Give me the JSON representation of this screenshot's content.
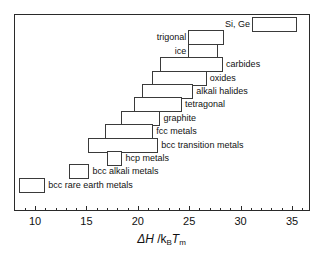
{
  "chart_data": {
    "type": "bar",
    "orientation": "horizontal-range",
    "title": "",
    "xlabel": "ΔH /k_B T_m",
    "ylabel": "",
    "xlim": [
      7.5,
      36.8
    ],
    "xticks": [
      10,
      15,
      20,
      25,
      30,
      35
    ],
    "xtick_labels": [
      "10",
      "15",
      "20",
      "25",
      "30",
      "35"
    ],
    "minor_tick_step": 1,
    "grid": false,
    "legend": "none",
    "categories": [
      "Si, Ge",
      "trigonal",
      "ice",
      "carbides",
      "oxides",
      "alkali halides",
      "tetragonal",
      "graphite",
      "fcc  metals",
      "bcc transition metals",
      "hcp metals",
      "bcc alkali metals",
      "bcc rare earth metals"
    ],
    "ranges": [
      {
        "label": "Si, Ge",
        "start": 31.1,
        "end": 35.5,
        "label_side": "left"
      },
      {
        "label": "trigonal",
        "start": 24.9,
        "end": 28.4,
        "label_side": "left"
      },
      {
        "label": "ice",
        "start": 24.9,
        "end": 27.8,
        "label_side": "left"
      },
      {
        "label": "carbides",
        "start": 22.2,
        "end": 28.3,
        "label_side": "right"
      },
      {
        "label": "oxides",
        "start": 21.4,
        "end": 26.7,
        "label_side": "right"
      },
      {
        "label": "alkali halides",
        "start": 20.4,
        "end": 25.4,
        "label_side": "right"
      },
      {
        "label": "tetragonal",
        "start": 19.6,
        "end": 24.3,
        "label_side": "right"
      },
      {
        "label": "graphite",
        "start": 18.4,
        "end": 22.2,
        "label_side": "right"
      },
      {
        "label": "fcc  metals",
        "start": 16.8,
        "end": 21.5,
        "label_side": "right"
      },
      {
        "label": "bcc transition metals",
        "start": 15.2,
        "end": 22.0,
        "label_side": "right"
      },
      {
        "label": "hcp metals",
        "start": 17.0,
        "end": 18.5,
        "label_side": "right"
      },
      {
        "label": "bcc alkali metals",
        "start": 13.3,
        "end": 15.3,
        "label_side": "right"
      },
      {
        "label": "bcc rare earth metals",
        "start": 8.4,
        "end": 11.0,
        "label_side": "right"
      }
    ]
  },
  "axis": {
    "title_delta": "ΔH",
    "title_slash": " /k",
    "title_sub_b": "B",
    "title_t": "T",
    "title_sub_m": "m"
  }
}
